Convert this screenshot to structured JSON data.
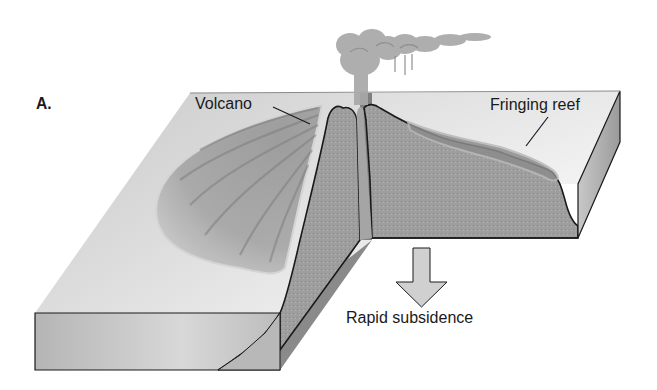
{
  "figure": {
    "panel_letter": "A.",
    "labels": {
      "volcano": "Volcano",
      "fringing_reef": "Fringing reef",
      "process": "Rapid subsidence"
    },
    "arrow_direction": "down",
    "colors": {
      "background": "#ffffff",
      "top_surface_light": "#e8e8e8",
      "top_surface_shade": "#bdbdbd",
      "cross_section": "#9c9c9c",
      "cut_face_dark": "#7d7d7d",
      "outline": "#1a1a1a",
      "arrow_fill": "#d0d0d0",
      "plume": "#a9a9a9"
    }
  }
}
